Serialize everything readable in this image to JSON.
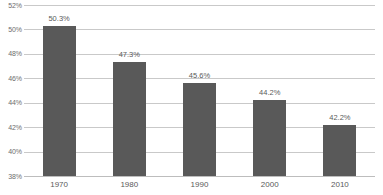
{
  "chart_data": {
    "type": "bar",
    "title": "",
    "subtitle": "",
    "xlabel": "",
    "ylabel": "",
    "categories": [
      "1970",
      "1980",
      "1990",
      "2000",
      "2010"
    ],
    "values": [
      50.3,
      47.3,
      45.6,
      44.2,
      42.2
    ],
    "data_labels": [
      "50.3%",
      "47.3%",
      "45.6%",
      "44.2%",
      "42.2%"
    ],
    "ylim": [
      38,
      52
    ],
    "ytick_step": 2,
    "ytick_labels": [
      "52%",
      "50%",
      "48%",
      "46%",
      "44%",
      "42%",
      "40%",
      "38%"
    ],
    "ytick_values": [
      52,
      50,
      48,
      46,
      44,
      42,
      40,
      38
    ],
    "grid": "horizontal",
    "legend": "none",
    "series": [
      {
        "name": "",
        "values": [
          50.3,
          47.3,
          45.6,
          44.2,
          42.2
        ]
      }
    ]
  },
  "style": {
    "bar_color": "#595959",
    "gridline_color": "#c9c9c9",
    "baseline_color": "#bdbdbd",
    "label_color": "#5a5a5a",
    "axis_label_color": "#6d6d6d",
    "background": "#ffffff"
  }
}
